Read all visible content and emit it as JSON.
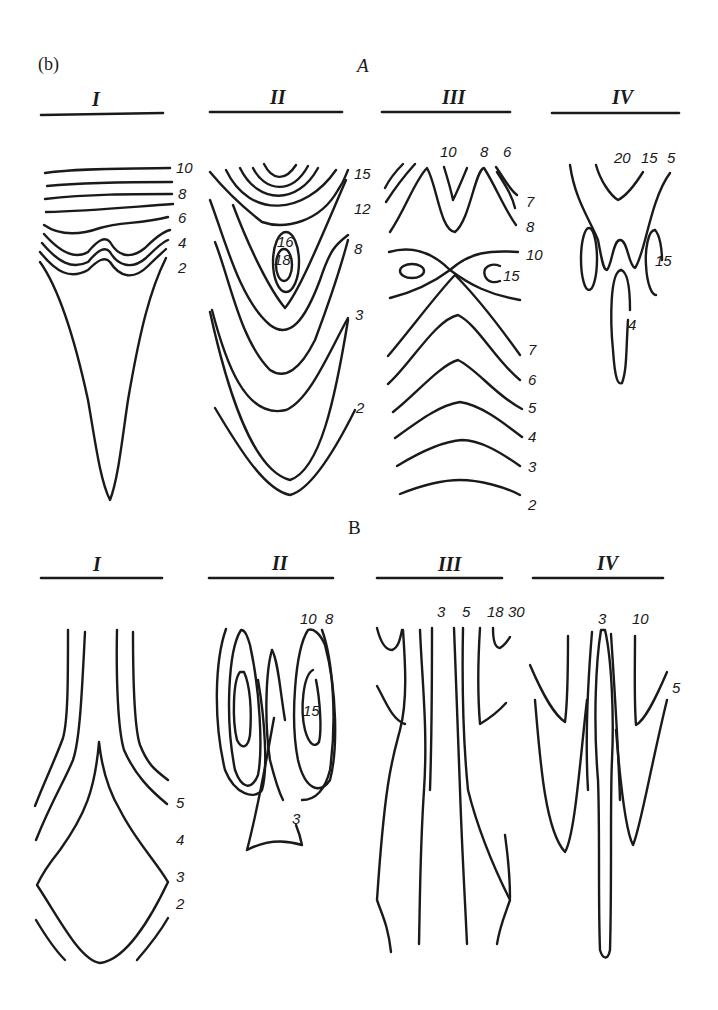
{
  "figure": {
    "tag": "(b)",
    "rows": [
      {
        "label": "A",
        "panels": [
          {
            "title": "I",
            "contour_labels": [
              "10",
              "8",
              "6",
              "4",
              "2"
            ]
          },
          {
            "title": "II",
            "contour_labels": [
              "15",
              "12",
              "16",
              "18",
              "8",
              "3",
              "2"
            ]
          },
          {
            "title": "III",
            "contour_labels": [
              "10",
              "8",
              "6",
              "7",
              "8",
              "10",
              "15",
              "7",
              "6",
              "5",
              "4",
              "3",
              "2"
            ]
          },
          {
            "title": "IV",
            "contour_labels": [
              "20",
              "15",
              "5",
              "15",
              "4"
            ]
          }
        ]
      },
      {
        "label": "B",
        "panels": [
          {
            "title": "I",
            "contour_labels": [
              "5",
              "4",
              "3",
              "2"
            ]
          },
          {
            "title": "II",
            "contour_labels": [
              "10",
              "8",
              "15",
              "3"
            ]
          },
          {
            "title": "III",
            "contour_labels": [
              "3",
              "5",
              "18",
              "30"
            ]
          },
          {
            "title": "IV",
            "contour_labels": [
              "3",
              "10",
              "5"
            ]
          }
        ]
      }
    ]
  },
  "colors": {
    "ink": "#1a1a1a",
    "background": "#ffffff"
  }
}
